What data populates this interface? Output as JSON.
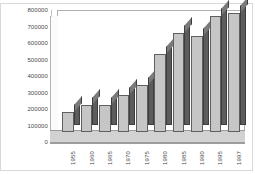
{
  "chart_data": {
    "type": "bar",
    "title": "",
    "subtitle": "",
    "xlabel": "",
    "ylabel": "",
    "categories": [
      "1955",
      "1960",
      "1965",
      "1970",
      "1975",
      "1980",
      "1985",
      "1990",
      "1995",
      "1997"
    ],
    "values": [
      130000,
      180000,
      180000,
      240000,
      310000,
      510000,
      650000,
      630000,
      760000,
      780000
    ],
    "ylim": [
      0,
      800000
    ],
    "yticks": [
      0,
      100000,
      200000,
      300000,
      400000,
      500000,
      600000,
      700000,
      800000
    ],
    "ytick_labels": [
      "0",
      "100000",
      "200000",
      "300000",
      "400000",
      "500000",
      "600000",
      "700000",
      "800000"
    ],
    "xtick_labels": [
      "1955",
      "1960",
      "1965",
      "1970",
      "1975",
      "1980",
      "1985",
      "1990",
      "1995",
      "1997"
    ],
    "grid": false,
    "legend": null,
    "legend_position": "none",
    "style": "3d-bar",
    "series": [
      {
        "name": "",
        "values": [
          130000,
          180000,
          180000,
          240000,
          310000,
          510000,
          650000,
          630000,
          760000,
          780000
        ]
      }
    ],
    "colors": {
      "bar_front": "#c6c6c6",
      "bar_side": "#5c5c5c",
      "bar_top": "#7a7a7a",
      "bar_outline": "#5f5f5f",
      "floor": "#d2d2d2",
      "plot_background": "#ffffff",
      "frame": "#d8d8d8",
      "axis_text": "#4a4a4a"
    }
  }
}
